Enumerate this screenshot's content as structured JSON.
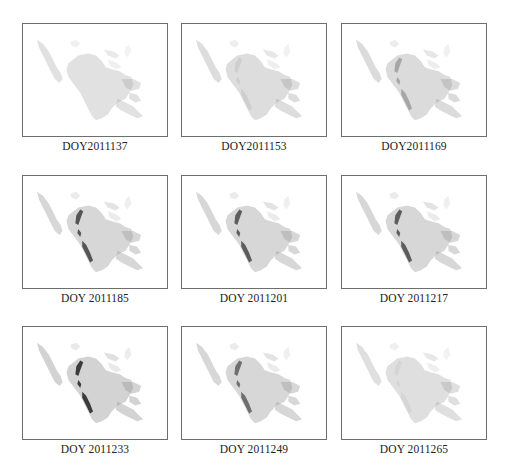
{
  "figure": {
    "layout": {
      "rows": 3,
      "cols": 3
    },
    "border_color": "#6e6e6e",
    "panels": [
      {
        "label": "DOY2011137",
        "base": 0.3,
        "dark": 0.0,
        "x": 22,
        "y": 23
      },
      {
        "label": "DOY2011153",
        "base": 0.34,
        "dark": 0.08,
        "x": 181,
        "y": 23
      },
      {
        "label": "DOY2011169",
        "base": 0.36,
        "dark": 0.3,
        "x": 341,
        "y": 23
      },
      {
        "label": "DOY 2011185",
        "base": 0.4,
        "dark": 0.75,
        "x": 22,
        "y": 175
      },
      {
        "label": "DOY 2011201",
        "base": 0.4,
        "dark": 0.7,
        "x": 181,
        "y": 175
      },
      {
        "label": "DOY 2011217",
        "base": 0.4,
        "dark": 0.7,
        "x": 341,
        "y": 175
      },
      {
        "label": "DOY 2011233",
        "base": 0.44,
        "dark": 0.9,
        "x": 22,
        "y": 326
      },
      {
        "label": "DOY 2011249",
        "base": 0.4,
        "dark": 0.6,
        "x": 181,
        "y": 326
      },
      {
        "label": "DOY 2011265",
        "base": 0.32,
        "dark": 0.05,
        "x": 341,
        "y": 326
      }
    ]
  }
}
